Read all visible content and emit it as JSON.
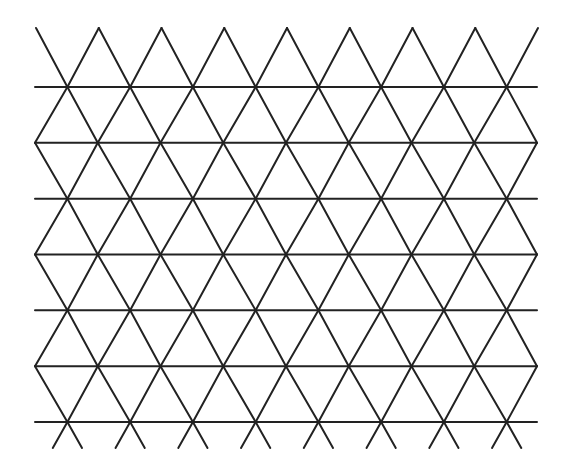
{
  "diagram": {
    "type": "triangular-grid",
    "stroke_color": "#222222",
    "background_color": "#ffffff",
    "stroke_width": 2,
    "horizontal_lines_y": [
      87,
      142.8,
      198.7,
      254.5,
      310.3,
      366.2,
      422
    ],
    "line_x_start": 35,
    "line_x_end": 537,
    "vertex_spacing_x": 62.75,
    "odd_row_vertex_x0": 67.4,
    "even_row_vertex_x0": 35,
    "top_apex_y": 28,
    "bottom_stub_y": 448,
    "horizontal_line_count": 7,
    "columns_per_row": 8
  }
}
